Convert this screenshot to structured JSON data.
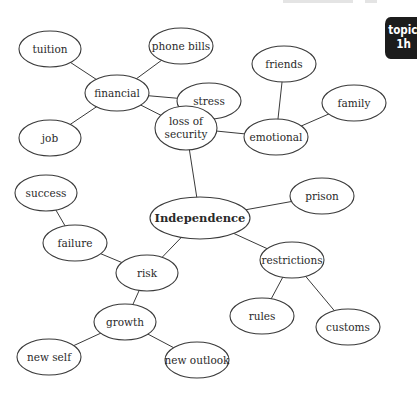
{
  "tab": {
    "line1": "topic",
    "line2": "1h",
    "bg": "#1c1c1c"
  },
  "diagram": {
    "nodes": [
      {
        "id": "tuition",
        "label": "tuition",
        "cx": 50,
        "cy": 49,
        "rx": 31,
        "ry": 18
      },
      {
        "id": "phone-bills",
        "label": "phone bills",
        "cx": 181,
        "cy": 46,
        "rx": 32,
        "ry": 18
      },
      {
        "id": "financial",
        "label": "financial",
        "cx": 117,
        "cy": 93,
        "rx": 32,
        "ry": 18
      },
      {
        "id": "stress",
        "label": "stress",
        "cx": 209,
        "cy": 101,
        "rx": 32,
        "ry": 18
      },
      {
        "id": "job",
        "label": "job",
        "cx": 50,
        "cy": 138,
        "rx": 31,
        "ry": 18
      },
      {
        "id": "loss-of-security",
        "label": "loss of",
        "label2": "security",
        "cx": 186,
        "cy": 128,
        "rx": 31,
        "ry": 22
      },
      {
        "id": "friends",
        "label": "friends",
        "cx": 284,
        "cy": 64,
        "rx": 32,
        "ry": 18
      },
      {
        "id": "family",
        "label": "family",
        "cx": 354,
        "cy": 103,
        "rx": 32,
        "ry": 18
      },
      {
        "id": "emotional",
        "label": "emotional",
        "cx": 276,
        "cy": 137,
        "rx": 32,
        "ry": 18
      },
      {
        "id": "success",
        "label": "success",
        "cx": 46,
        "cy": 193,
        "rx": 31,
        "ry": 18
      },
      {
        "id": "independence",
        "label": "Independence",
        "cx": 200,
        "cy": 218,
        "rx": 50,
        "ry": 21,
        "central": true
      },
      {
        "id": "prison",
        "label": "prison",
        "cx": 322,
        "cy": 196,
        "rx": 32,
        "ry": 18
      },
      {
        "id": "failure",
        "label": "failure",
        "cx": 75,
        "cy": 243,
        "rx": 32,
        "ry": 18
      },
      {
        "id": "risk",
        "label": "risk",
        "cx": 147,
        "cy": 273,
        "rx": 31,
        "ry": 18
      },
      {
        "id": "restrictions",
        "label": "restrictions",
        "cx": 292,
        "cy": 260,
        "rx": 32,
        "ry": 18
      },
      {
        "id": "growth",
        "label": "growth",
        "cx": 125,
        "cy": 322,
        "rx": 31,
        "ry": 18
      },
      {
        "id": "rules",
        "label": "rules",
        "cx": 262,
        "cy": 316,
        "rx": 32,
        "ry": 18
      },
      {
        "id": "customs",
        "label": "customs",
        "cx": 348,
        "cy": 327,
        "rx": 32,
        "ry": 18
      },
      {
        "id": "new-self",
        "label": "new self",
        "cx": 49,
        "cy": 357,
        "rx": 32,
        "ry": 18
      },
      {
        "id": "new-outlook",
        "label": "new outlook",
        "cx": 197,
        "cy": 360,
        "rx": 32,
        "ry": 18
      }
    ],
    "edges": [
      [
        "tuition",
        "financial"
      ],
      [
        "phone-bills",
        "financial"
      ],
      [
        "stress",
        "financial"
      ],
      [
        "job",
        "financial"
      ],
      [
        "financial",
        "loss-of-security"
      ],
      [
        "loss-of-security",
        "emotional"
      ],
      [
        "emotional",
        "friends"
      ],
      [
        "emotional",
        "family"
      ],
      [
        "loss-of-security",
        "independence"
      ],
      [
        "independence",
        "prison"
      ],
      [
        "independence",
        "restrictions"
      ],
      [
        "independence",
        "risk"
      ],
      [
        "restrictions",
        "rules"
      ],
      [
        "restrictions",
        "customs"
      ],
      [
        "risk",
        "failure"
      ],
      [
        "failure",
        "success"
      ],
      [
        "risk",
        "growth"
      ],
      [
        "growth",
        "new-self"
      ],
      [
        "growth",
        "new-outlook"
      ]
    ]
  }
}
